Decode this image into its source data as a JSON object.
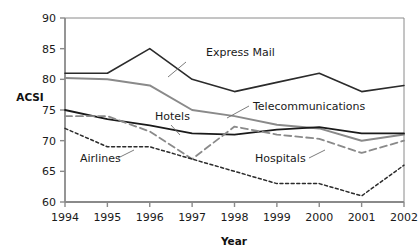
{
  "chart_data": {
    "type": "line",
    "title": "",
    "xlabel": "Year",
    "ylabel": "ACSI",
    "categories": [
      "1994",
      "1995",
      "1996",
      "1997",
      "1998",
      "1999",
      "2000",
      "2001",
      "2002"
    ],
    "x": [
      1994,
      1995,
      1996,
      1997,
      1998,
      1999,
      2000,
      2001,
      2002
    ],
    "xlim": [
      1994,
      2002
    ],
    "ylim": [
      60,
      90
    ],
    "yticks": [
      60,
      65,
      70,
      75,
      80,
      85,
      90
    ],
    "ytick_labels": [
      "60",
      "65",
      "70",
      "75",
      "80",
      "85",
      "90"
    ],
    "grid": false,
    "legend": "inline-annotations",
    "series": [
      {
        "name": "Express Mail",
        "values": [
          81,
          81,
          85,
          80,
          78,
          79.5,
          81,
          78,
          79
        ],
        "color": "#2b2b2b",
        "style": "solid",
        "width": 1.6
      },
      {
        "name": "Telecommunications",
        "values": [
          80.2,
          80,
          79,
          75,
          74,
          72.6,
          72,
          70,
          71
        ],
        "color": "#8a8a8a",
        "style": "solid",
        "width": 2.0
      },
      {
        "name": "Hotels",
        "values": [
          75,
          73.5,
          72.5,
          71.2,
          71,
          71.8,
          72.2,
          71.2,
          71.2
        ],
        "color": "#1a1a1a",
        "style": "solid",
        "width": 1.8
      },
      {
        "name": "Hospitals",
        "values": [
          74,
          74,
          71.5,
          67,
          72.3,
          71,
          70.3,
          68,
          70
        ],
        "color": "#8a8a8a",
        "style": "dashed",
        "width": 1.8
      },
      {
        "name": "Airlines",
        "values": [
          72,
          69,
          69,
          67,
          65,
          63,
          63,
          61,
          66
        ],
        "color": "#2b2b2b",
        "style": "dotted",
        "width": 1.5
      }
    ],
    "annotations": [
      {
        "text": "Express Mail",
        "series": "Express Mail",
        "x": 206,
        "y": 56,
        "leader": [
          [
            186,
            62
          ],
          [
            168,
            77
          ]
        ]
      },
      {
        "text": "Telecommunications",
        "series": "Telecommunications",
        "x": 253,
        "y": 110,
        "leader": [
          [
            249,
            106
          ],
          [
            227,
            118
          ]
        ]
      },
      {
        "text": "Hotels",
        "series": "Hotels",
        "x": 155,
        "y": 120,
        "leader": [
          [
            171,
            125
          ],
          [
            180,
            135
          ]
        ]
      },
      {
        "text": "Hospitals",
        "series": "Hospitals",
        "x": 255,
        "y": 162,
        "leader": [
          [
            309,
            158
          ],
          [
            325,
            150
          ]
        ]
      },
      {
        "text": "Airlines",
        "series": "Airlines",
        "x": 80,
        "y": 162,
        "leader": [
          [
            118,
            158
          ],
          [
            134,
            150
          ]
        ]
      }
    ],
    "axis_color": "#8a8a8a",
    "background": "#ffffff"
  }
}
